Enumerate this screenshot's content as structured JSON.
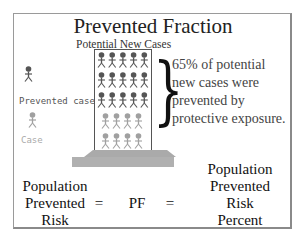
{
  "title": "Prevented Fraction",
  "column_label": "Potential New Cases",
  "legend": [
    {
      "label": "Prevented case",
      "color": "#555555"
    },
    {
      "label": "Case",
      "color": "#a0a0a0"
    }
  ],
  "figure_grid": {
    "prevented_rows": 3,
    "prevented_cols": 5,
    "case_rows": 2,
    "case_cols": 4,
    "prevented_color": "#555555",
    "case_color": "#a0a0a0"
  },
  "annotation": {
    "line1": "65% of potential",
    "line2": "new cases were",
    "line3": "prevented by",
    "line4": "protective exposure."
  },
  "equation": {
    "left": [
      "Population",
      "Prevented",
      "Risk"
    ],
    "eq1": "=",
    "middle": "PF",
    "eq2": "=",
    "right": [
      "Population",
      "Prevented",
      "Risk",
      "Percent"
    ]
  }
}
